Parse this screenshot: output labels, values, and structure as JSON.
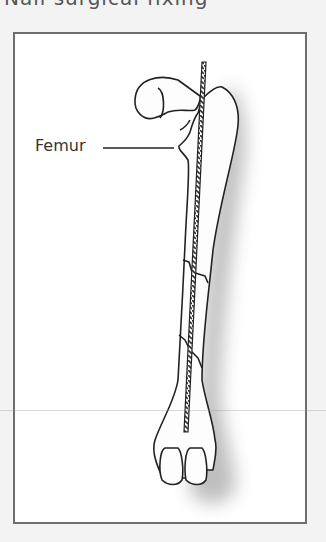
{
  "header": {
    "partial_text": "Nail surgical fixing"
  },
  "figure": {
    "label": "Femur",
    "frame_color": "#6e6e6e",
    "background": "#ffffff",
    "line_color": "#222222",
    "shadow_color": "#bbbbbb"
  }
}
